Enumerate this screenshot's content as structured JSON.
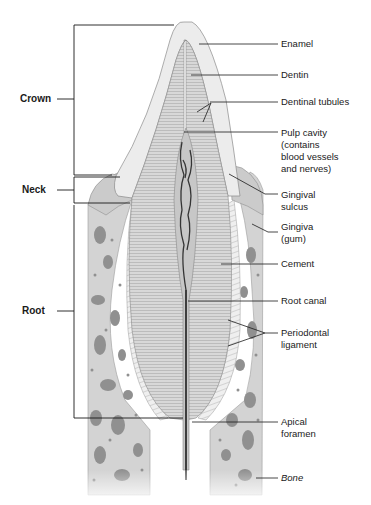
{
  "figure": {
    "colors": {
      "background": "#ffffff",
      "enamel": "#ececec",
      "dentin": "#d9d9d9",
      "pulp": "#c9c9c9",
      "vessels": "#3a3a3a",
      "gingiva": "#cfcfcf",
      "bone": "#d4d4d4",
      "bone_cavities": "#8e8e8e",
      "ligament": "#eeeeee",
      "leader_lines": "#1a1a1a"
    }
  },
  "left_labels": {
    "crown": "Crown",
    "neck": "Neck",
    "root": "Root"
  },
  "right_labels": {
    "enamel": "Enamel",
    "dentin": "Dentin",
    "dentinal_tubules": "Dentinal tubules",
    "pulp_cavity": "Pulp cavity\n(contains\nblood vessels\nand nerves)",
    "gingival_sulcus": "Gingival\nsulcus",
    "gingiva": "Gingiva\n(gum)",
    "cement": "Cement",
    "root_canal": "Root canal",
    "periodontal_ligament": "Periodontal\nligament",
    "apical_foramen": "Apical\nforamen",
    "bone": "Bone"
  }
}
